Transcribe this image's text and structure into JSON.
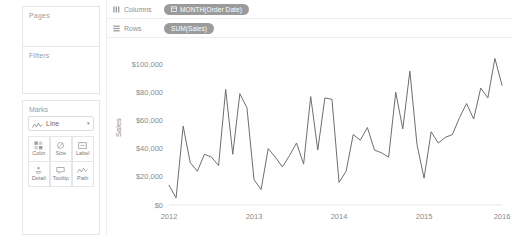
{
  "sidebar": {
    "pages": {
      "title": "Pages"
    },
    "filters": {
      "title": "Filters"
    },
    "marks": {
      "title": "Marks",
      "mark_type": "Line",
      "mark_type_icon": "line-chart-icon",
      "caret_icon": "▾",
      "buttons": [
        {
          "label": "Color",
          "icon": "color-palette-icon"
        },
        {
          "label": "Size",
          "icon": "size-icon"
        },
        {
          "label": "Label",
          "icon": "label-icon"
        },
        {
          "label": "Detail",
          "icon": "detail-icon"
        },
        {
          "label": "Tooltip",
          "icon": "tooltip-icon"
        },
        {
          "label": "Path",
          "icon": "path-icon"
        }
      ]
    }
  },
  "shelves": [
    {
      "name": "columns",
      "label": "Columns",
      "icon": "columns-icon",
      "pill": {
        "text": "MONTH(Order Date)",
        "icon": "calendar-icon"
      }
    },
    {
      "name": "rows",
      "label": "Rows",
      "icon": "rows-icon",
      "pill": {
        "text": "SUM(Sales)",
        "icon": ""
      }
    }
  ],
  "colors": {
    "line": "#6e6e6e",
    "pill": "#9b9b9b",
    "axis_text": "#8a8a8a",
    "border": "#e6e6e6"
  },
  "chart_data": {
    "type": "line",
    "title": "",
    "xlabel": "",
    "ylabel": "Sales",
    "ylim": [
      0,
      110000
    ],
    "yticks": [
      0,
      20000,
      40000,
      60000,
      80000,
      100000
    ],
    "ytick_labels": [
      "$0",
      "$20,000",
      "$40,000",
      "$60,000",
      "$80,000",
      "$100,000"
    ],
    "xtick_labels": [
      "2012",
      "2013",
      "2014",
      "2015",
      "2016"
    ],
    "xtick_values": [
      "2012-01",
      "2013-01",
      "2014-01",
      "2015-01",
      "2016-01"
    ],
    "grid": false,
    "legend": "none",
    "series": [
      {
        "name": "SUM(Sales)",
        "x": [
          "2012-01",
          "2012-02",
          "2012-03",
          "2012-04",
          "2012-05",
          "2012-06",
          "2012-07",
          "2012-08",
          "2012-09",
          "2012-10",
          "2012-11",
          "2012-12",
          "2013-01",
          "2013-02",
          "2013-03",
          "2013-04",
          "2013-05",
          "2013-06",
          "2013-07",
          "2013-08",
          "2013-09",
          "2013-10",
          "2013-11",
          "2013-12",
          "2014-01",
          "2014-02",
          "2014-03",
          "2014-04",
          "2014-05",
          "2014-06",
          "2014-07",
          "2014-08",
          "2014-09",
          "2014-10",
          "2014-11",
          "2014-12",
          "2015-01",
          "2015-02",
          "2015-03",
          "2015-04",
          "2015-05",
          "2015-06",
          "2015-07",
          "2015-08",
          "2015-09",
          "2015-10",
          "2015-11",
          "2015-12"
        ],
        "values": [
          14000,
          5000,
          56000,
          30000,
          24000,
          36000,
          34000,
          28000,
          82000,
          36000,
          79000,
          69000,
          18000,
          11000,
          40000,
          34000,
          27000,
          35000,
          44000,
          29000,
          77000,
          39000,
          76000,
          75000,
          16000,
          24000,
          50000,
          46000,
          55000,
          39000,
          37000,
          34000,
          80000,
          54000,
          95000,
          43000,
          19000,
          52000,
          44000,
          48000,
          50000,
          62000,
          72000,
          61000,
          83000,
          76000,
          104000,
          85000
        ]
      }
    ]
  }
}
